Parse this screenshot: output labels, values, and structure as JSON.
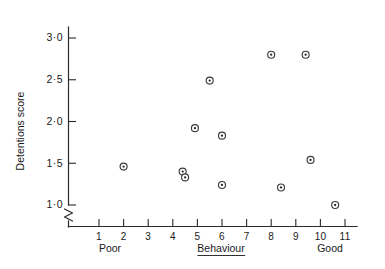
{
  "chart_data": {
    "type": "scatter",
    "title": "",
    "xlabel": "Behaviour",
    "ylabel": "Detentions score",
    "xlim": [
      0,
      11.8
    ],
    "ylim": [
      0.85,
      3.15
    ],
    "grid": false,
    "legend": null,
    "y_axis_broken": true,
    "y_axis_break_note": "axis break (zigzag) between origin and 1.0",
    "x_tick_labels": [
      "1",
      "2",
      "3",
      "4",
      "5",
      "6",
      "7",
      "8",
      "9",
      "10",
      "11"
    ],
    "x_tick_values": [
      1,
      2,
      3,
      4,
      5,
      6,
      7,
      8,
      9,
      10,
      11
    ],
    "y_tick_labels": [
      "1·0",
      "1·5",
      "2·0",
      "2·5",
      "3·0"
    ],
    "y_tick_values": [
      1.0,
      1.5,
      2.0,
      2.5,
      3.0
    ],
    "x_axis_low_label": "Poor",
    "x_axis_high_label": "Good",
    "points": [
      {
        "x": 2.0,
        "y": 1.46
      },
      {
        "x": 4.4,
        "y": 1.4
      },
      {
        "x": 4.5,
        "y": 1.33
      },
      {
        "x": 4.9,
        "y": 1.92
      },
      {
        "x": 5.5,
        "y": 2.49
      },
      {
        "x": 6.0,
        "y": 1.24
      },
      {
        "x": 6.0,
        "y": 1.83
      },
      {
        "x": 8.0,
        "y": 2.8
      },
      {
        "x": 8.4,
        "y": 1.21
      },
      {
        "x": 9.4,
        "y": 2.8
      },
      {
        "x": 9.6,
        "y": 1.54
      },
      {
        "x": 10.6,
        "y": 1.0
      }
    ],
    "marker_style": "circle-with-center-dot",
    "colors": {
      "axis": "#2b2b2b",
      "marker_stroke": "#3a3a3a",
      "marker_fill": "#ffffff",
      "marker_dot": "#2b2b2b",
      "background": "#ffffff",
      "text": "#1a1a1a"
    }
  }
}
